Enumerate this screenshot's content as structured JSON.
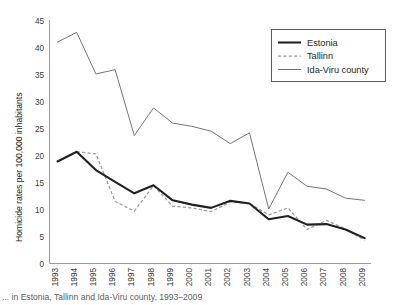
{
  "figure": {
    "caption": "... in Estonia, Tallinn and Ida-Viru county, 1993–2009"
  },
  "legend": {
    "position": "top-right",
    "items": [
      {
        "label": "Estonia",
        "style": "solid-thick",
        "color": "#231f20"
      },
      {
        "label": "Tallinn",
        "style": "dashed",
        "color": "#9a9a9a"
      },
      {
        "label": "Ida-Viru county",
        "style": "solid-thin",
        "color": "#6d6d6d"
      }
    ]
  },
  "axes": {
    "y_tick_labels": [
      "45",
      "40",
      "35",
      "30",
      "25",
      "20",
      "15",
      "10",
      "5",
      "0"
    ],
    "x_tick_labels": [
      "1993",
      "1994",
      "1995",
      "1996",
      "1997",
      "1998",
      "1999",
      "2000",
      "2001",
      "2002",
      "2003",
      "2004",
      "2005",
      "2006",
      "2007",
      "2008",
      "2009"
    ]
  },
  "chart_data": {
    "type": "line",
    "title": "",
    "subtitle": "",
    "xlabel": "",
    "ylabel": "Homicide rates per 100,000 inhabitants",
    "x": [
      1993,
      1994,
      1995,
      1996,
      1997,
      1998,
      1999,
      2000,
      2001,
      2002,
      2003,
      2004,
      2005,
      2006,
      2007,
      2008,
      2009
    ],
    "categories": [
      "1993",
      "1994",
      "1995",
      "1996",
      "1997",
      "1998",
      "1999",
      "2000",
      "2001",
      "2002",
      "2003",
      "2004",
      "2005",
      "2006",
      "2007",
      "2008",
      "2009"
    ],
    "xlim": [
      1993,
      2009
    ],
    "ylim": [
      0,
      45
    ],
    "ytick_step": 5,
    "grid": false,
    "legend_position": "top-right",
    "series": [
      {
        "name": "Estonia",
        "color": "#231f20",
        "style": "solid-thick",
        "values": [
          18.9,
          20.7,
          17.3,
          15.1,
          13.0,
          14.5,
          11.7,
          10.9,
          10.3,
          11.6,
          11.1,
          8.2,
          8.8,
          7.2,
          7.3,
          6.3,
          4.7
        ]
      },
      {
        "name": "Tallinn",
        "color": "#9a9a9a",
        "style": "dashed",
        "values": [
          18.9,
          20.7,
          20.3,
          11.5,
          9.7,
          14.4,
          10.6,
          10.3,
          9.6,
          11.4,
          11.1,
          9.0,
          10.3,
          6.3,
          8.0,
          6.4,
          4.3
        ]
      },
      {
        "name": "Ida-Viru county",
        "color": "#6d6d6d",
        "style": "solid-thin",
        "values": [
          41.0,
          42.8,
          35.1,
          35.9,
          23.7,
          28.8,
          26.0,
          25.4,
          24.5,
          22.2,
          24.2,
          10.1,
          16.9,
          14.3,
          13.8,
          12.1,
          11.7
        ]
      }
    ]
  }
}
